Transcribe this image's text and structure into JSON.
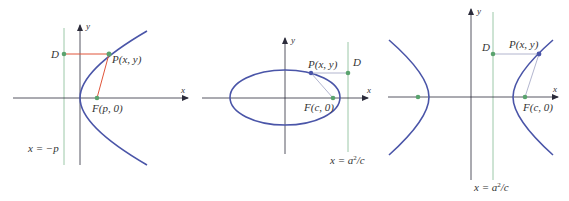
{
  "colors": {
    "axis": "#2b2b3a",
    "curve": "#4a55a8",
    "directrix": "#9cc8a8",
    "point": "#5aa36e",
    "parabola_segments": "#e0553a",
    "conic_segments": "#a9adc8",
    "text": "#333333"
  },
  "panels": [
    {
      "name": "parabola",
      "axis_labels": {
        "x": "x",
        "y": "y"
      },
      "points": {
        "D": "D",
        "P": "P(x, y)",
        "F": "F(p, 0)"
      },
      "directrix_label": "x = −p"
    },
    {
      "name": "ellipse",
      "axis_labels": {
        "x": "x",
        "y": "y"
      },
      "points": {
        "D": "D",
        "P": "P(x, y)",
        "F": "F(c, 0)"
      },
      "directrix_label": {
        "prefix": "x = a",
        "sup": "2",
        "suffix": "/c"
      }
    },
    {
      "name": "hyperbola",
      "axis_labels": {
        "x": "x",
        "y": "y"
      },
      "points": {
        "D": "D",
        "P": "P(x, y)",
        "F": "F(c, 0)"
      },
      "directrix_label": {
        "prefix": "x = a",
        "sup": "2",
        "suffix": "/c"
      }
    }
  ]
}
